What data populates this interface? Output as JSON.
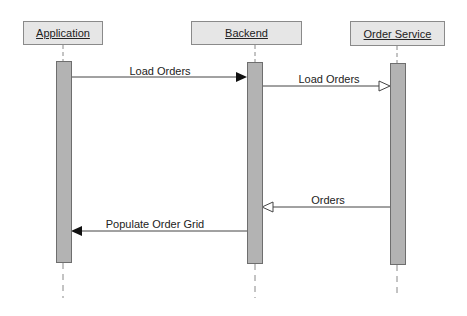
{
  "participants": [
    {
      "name": "Application"
    },
    {
      "name": "Backend"
    },
    {
      "name": "Order Service"
    }
  ],
  "messages": [
    {
      "label": "Load Orders",
      "from": "Application",
      "to": "Backend",
      "arrow": "filled"
    },
    {
      "label": "Load Orders",
      "from": "Backend",
      "to": "Order Service",
      "arrow": "open"
    },
    {
      "label": "Orders",
      "from": "Order Service",
      "to": "Backend",
      "arrow": "open"
    },
    {
      "label": "Populate Order Grid",
      "from": "Backend",
      "to": "Application",
      "arrow": "filled"
    }
  ]
}
